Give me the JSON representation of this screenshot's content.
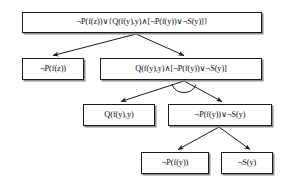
{
  "diagram": {
    "type": "semantic-tableau-tree",
    "title": "",
    "nodes": [
      {
        "id": "root",
        "formula": "¬P(f(z))∨{Q(f(y),y)∧[¬P(f(y))∨¬S(y)]}",
        "level": 0
      },
      {
        "id": "l1",
        "formula": "¬P(f(z))",
        "level": 1
      },
      {
        "id": "r1",
        "formula": "Q(f(y),y)∧[¬P(f(y))∨¬S(y)]",
        "level": 1
      },
      {
        "id": "l2",
        "formula": "Q(f(y),y)",
        "level": 2
      },
      {
        "id": "r2",
        "formula": "¬P(f(y))∨¬S(y)",
        "level": 2
      },
      {
        "id": "l3",
        "formula": "¬P(f(y))",
        "level": 3
      },
      {
        "id": "r3",
        "formula": "¬S(y)",
        "level": 3
      }
    ],
    "edges": [
      {
        "from": "root",
        "to": "l1",
        "kind": "disjunction"
      },
      {
        "from": "root",
        "to": "r1",
        "kind": "disjunction"
      },
      {
        "from": "r1",
        "to": "l2",
        "kind": "conjunction"
      },
      {
        "from": "r1",
        "to": "r2",
        "kind": "conjunction"
      },
      {
        "from": "r2",
        "to": "l3",
        "kind": "disjunction"
      },
      {
        "from": "r2",
        "to": "r3",
        "kind": "disjunction"
      }
    ],
    "conjunction_markers": [
      {
        "at": "r1",
        "label": "conjunction-arc"
      }
    ],
    "colors": {
      "box_border": "#1a1a1a",
      "box_shadow": "#8d8d8d",
      "edge": "#1a1a1a",
      "text": "#0d0d0d",
      "background": "#ffffff"
    }
  }
}
